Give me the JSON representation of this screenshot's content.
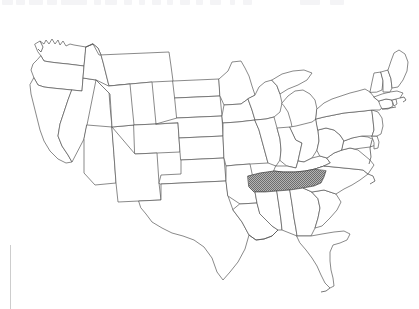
{
  "page": {
    "background_color": "#ffffff",
    "width": 419,
    "height": 309
  },
  "artifact": {
    "name": "clipped-text-strip",
    "description": "faint cut-off line of gray text at the top edge of the scan",
    "color": "#f4f4f6",
    "fragments": [
      {
        "x": 2,
        "w": 11
      },
      {
        "x": 16,
        "w": 9
      },
      {
        "x": 29,
        "w": 14
      },
      {
        "x": 47,
        "w": 10
      },
      {
        "x": 61,
        "w": 26
      },
      {
        "x": 94,
        "w": 7
      },
      {
        "x": 105,
        "w": 12
      },
      {
        "x": 124,
        "w": 8
      },
      {
        "x": 139,
        "w": 6
      },
      {
        "x": 152,
        "w": 9
      },
      {
        "x": 167,
        "w": 6
      },
      {
        "x": 180,
        "w": 10
      },
      {
        "x": 196,
        "w": 7
      },
      {
        "x": 210,
        "w": 11
      },
      {
        "x": 230,
        "w": 5
      },
      {
        "x": 243,
        "w": 9
      },
      {
        "x": 300,
        "w": 20
      },
      {
        "x": 330,
        "w": 14
      }
    ]
  },
  "rule": {
    "name": "left-vertical-rule",
    "color": "#cdcdcd",
    "x": 10,
    "y": 245,
    "height": 64
  },
  "map": {
    "name": "us-states-map",
    "projection": "contiguous-united-states",
    "outline_color": "#575757",
    "default_fill": "#ffffff",
    "highlight_fill": "#909090",
    "highlight_pattern": "dithered-hatch",
    "highlighted_states": [
      "Tennessee"
    ],
    "legend_visible": false,
    "labels_visible": false
  },
  "chart_data": {
    "type": "map",
    "region": "Contiguous United States (lower 48)",
    "highlighted": [
      {
        "state": "Tennessee",
        "abbr": "TN",
        "value": 1,
        "fill": "#909090"
      }
    ],
    "states": [
      {
        "abbr": "WA",
        "name": "Washington",
        "highlighted": false
      },
      {
        "abbr": "OR",
        "name": "Oregon",
        "highlighted": false
      },
      {
        "abbr": "CA",
        "name": "California",
        "highlighted": false
      },
      {
        "abbr": "ID",
        "name": "Idaho",
        "highlighted": false
      },
      {
        "abbr": "NV",
        "name": "Nevada",
        "highlighted": false
      },
      {
        "abbr": "MT",
        "name": "Montana",
        "highlighted": false
      },
      {
        "abbr": "WY",
        "name": "Wyoming",
        "highlighted": false
      },
      {
        "abbr": "UT",
        "name": "Utah",
        "highlighted": false
      },
      {
        "abbr": "AZ",
        "name": "Arizona",
        "highlighted": false
      },
      {
        "abbr": "CO",
        "name": "Colorado",
        "highlighted": false
      },
      {
        "abbr": "NM",
        "name": "New Mexico",
        "highlighted": false
      },
      {
        "abbr": "ND",
        "name": "North Dakota",
        "highlighted": false
      },
      {
        "abbr": "SD",
        "name": "South Dakota",
        "highlighted": false
      },
      {
        "abbr": "NE",
        "name": "Nebraska",
        "highlighted": false
      },
      {
        "abbr": "KS",
        "name": "Kansas",
        "highlighted": false
      },
      {
        "abbr": "OK",
        "name": "Oklahoma",
        "highlighted": false
      },
      {
        "abbr": "TX",
        "name": "Texas",
        "highlighted": false
      },
      {
        "abbr": "MN",
        "name": "Minnesota",
        "highlighted": false
      },
      {
        "abbr": "IA",
        "name": "Iowa",
        "highlighted": false
      },
      {
        "abbr": "MO",
        "name": "Missouri",
        "highlighted": false
      },
      {
        "abbr": "AR",
        "name": "Arkansas",
        "highlighted": false
      },
      {
        "abbr": "LA",
        "name": "Louisiana",
        "highlighted": false
      },
      {
        "abbr": "WI",
        "name": "Wisconsin",
        "highlighted": false
      },
      {
        "abbr": "IL",
        "name": "Illinois",
        "highlighted": false
      },
      {
        "abbr": "MI",
        "name": "Michigan",
        "highlighted": false
      },
      {
        "abbr": "IN",
        "name": "Indiana",
        "highlighted": false
      },
      {
        "abbr": "OH",
        "name": "Ohio",
        "highlighted": false
      },
      {
        "abbr": "KY",
        "name": "Kentucky",
        "highlighted": false
      },
      {
        "abbr": "TN",
        "name": "Tennessee",
        "highlighted": true
      },
      {
        "abbr": "MS",
        "name": "Mississippi",
        "highlighted": false
      },
      {
        "abbr": "AL",
        "name": "Alabama",
        "highlighted": false
      },
      {
        "abbr": "GA",
        "name": "Georgia",
        "highlighted": false
      },
      {
        "abbr": "FL",
        "name": "Florida",
        "highlighted": false
      },
      {
        "abbr": "SC",
        "name": "South Carolina",
        "highlighted": false
      },
      {
        "abbr": "NC",
        "name": "North Carolina",
        "highlighted": false
      },
      {
        "abbr": "VA",
        "name": "Virginia",
        "highlighted": false
      },
      {
        "abbr": "WV",
        "name": "West Virginia",
        "highlighted": false
      },
      {
        "abbr": "MD",
        "name": "Maryland",
        "highlighted": false
      },
      {
        "abbr": "DE",
        "name": "Delaware",
        "highlighted": false
      },
      {
        "abbr": "PA",
        "name": "Pennsylvania",
        "highlighted": false
      },
      {
        "abbr": "NJ",
        "name": "New Jersey",
        "highlighted": false
      },
      {
        "abbr": "NY",
        "name": "New York",
        "highlighted": false
      },
      {
        "abbr": "CT",
        "name": "Connecticut",
        "highlighted": false
      },
      {
        "abbr": "RI",
        "name": "Rhode Island",
        "highlighted": false
      },
      {
        "abbr": "MA",
        "name": "Massachusetts",
        "highlighted": false
      },
      {
        "abbr": "VT",
        "name": "Vermont",
        "highlighted": false
      },
      {
        "abbr": "NH",
        "name": "New Hampshire",
        "highlighted": false
      },
      {
        "abbr": "ME",
        "name": "Maine",
        "highlighted": false
      }
    ]
  }
}
